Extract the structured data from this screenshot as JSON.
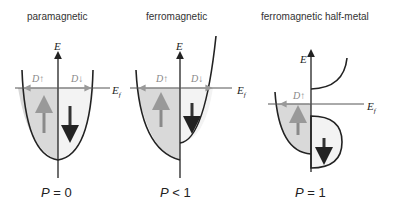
{
  "panels": [
    {
      "title": "paramagnetic",
      "p_label": "P",
      "p_relation": " = 0",
      "spin_up_label": "D↑",
      "spin_down_label": "D↓"
    },
    {
      "title": "ferromagnetic",
      "p_label": "P",
      "p_relation": " < 1",
      "spin_up_label": "D↑",
      "spin_down_label": "D↓"
    },
    {
      "title": "ferromagnetic half-metal",
      "p_label": "P",
      "p_relation": " = 1",
      "spin_up_label": "D↑"
    }
  ],
  "axis_labels": {
    "energy": "E",
    "fermi": "E",
    "fermi_sub": "f"
  },
  "colors": {
    "fill": "#d9d9d9",
    "line": "#222222",
    "gray_arrow": "#8a8a8a",
    "label_gray": "#888888"
  }
}
